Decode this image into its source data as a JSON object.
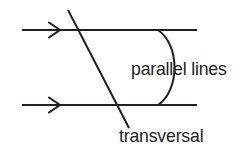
{
  "figure": {
    "background_color": "#ffffff",
    "ink_color": "#231f20",
    "width": 250,
    "height": 154
  },
  "labels": {
    "parallel_lines": "parallel lines",
    "transversal": "transversal"
  },
  "geometry": {
    "top_parallel_line": {
      "name": "top-parallel-line",
      "x1": 22,
      "y1": 30,
      "x2": 197,
      "y2": 30,
      "stroke_width": 2.0,
      "arrow_marker_at_x": 60,
      "arrow_direction": "right"
    },
    "bottom_parallel_line": {
      "name": "bottom-parallel-line",
      "x1": 22,
      "y1": 105,
      "x2": 197,
      "y2": 105,
      "stroke_width": 2.0,
      "arrow_marker_at_x": 60,
      "arrow_direction": "right"
    },
    "transversal_line": {
      "name": "transversal-line",
      "x1": 68,
      "y1": 10,
      "x2": 129,
      "y2": 128,
      "stroke_width": 2.0
    },
    "brace_arc": {
      "name": "parallel-lines-brace",
      "start_x": 158,
      "start_y": 30,
      "end_x": 158,
      "end_y": 105,
      "bulge_x": 183,
      "stroke_width": 2.0
    }
  }
}
